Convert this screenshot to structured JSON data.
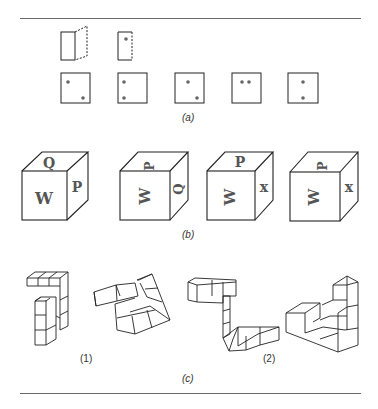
{
  "figure": {
    "panel_a": {
      "caption": "(a)",
      "folding_hint": "flat face with dashed folded flap; narrow face with one dot",
      "dice_faces": [
        {
          "dots": [
            [
              0.25,
              0.3
            ],
            [
              0.75,
              0.8
            ]
          ]
        },
        {
          "dots": [
            [
              0.2,
              0.3
            ],
            [
              0.2,
              0.8
            ]
          ]
        },
        {
          "dots": [
            [
              0.4,
              0.3
            ],
            [
              0.75,
              0.8
            ]
          ]
        },
        {
          "dots": [
            [
              0.3,
              0.3
            ],
            [
              0.55,
              0.3
            ]
          ]
        },
        {
          "dots": [
            [
              0.5,
              0.3
            ],
            [
              0.5,
              0.8
            ]
          ]
        }
      ]
    },
    "panel_b": {
      "caption": "(b)",
      "cubes": [
        {
          "top": "Q",
          "front": "W",
          "side": "P"
        },
        {
          "top": "P",
          "front": "W",
          "side": "Q"
        },
        {
          "top": "P",
          "front": "W",
          "side": "x"
        },
        {
          "top": "P",
          "front": "W",
          "side": "x"
        }
      ]
    },
    "panel_c": {
      "caption": "(c)",
      "pairs": [
        {
          "label": "(1)"
        },
        {
          "label": "(2)"
        }
      ]
    }
  }
}
